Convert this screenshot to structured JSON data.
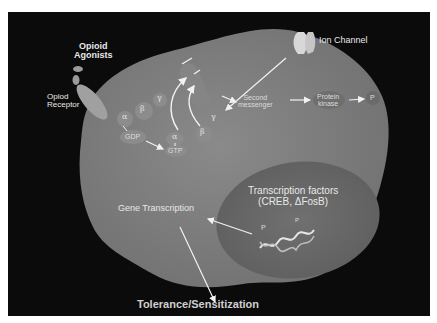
{
  "diagram": {
    "labels": {
      "opioid_agonists_line1": "Opioid",
      "opioid_agonists_line2": "Agonists",
      "opioid_receptor_line1": "Opiod",
      "opioid_receptor_line2": "Receptor",
      "ion_channel": "Ion Channel",
      "alpha": "α",
      "beta": "β",
      "gamma": "γ",
      "gdp": "GDP",
      "gtp": "GTP",
      "second_messenger_line1": "Second",
      "second_messenger_line2": "messenger",
      "protein_kinase_line1": "Protein",
      "protein_kinase_line2": "kinase",
      "phosphate": "P",
      "transcription_factors_line1": "Transcription factors",
      "transcription_factors_line2": "(CREB,  ΔFosB)",
      "gene_transcription": "Gene Transcription",
      "outcome": "Tolerance/Sensitization"
    },
    "colors": {
      "background": "#0b0b0b",
      "cell": "#7a7a7a",
      "nucleus": "#6a6a6a",
      "text": "#e8e8e8",
      "arrow": "#f2f2f2"
    }
  }
}
